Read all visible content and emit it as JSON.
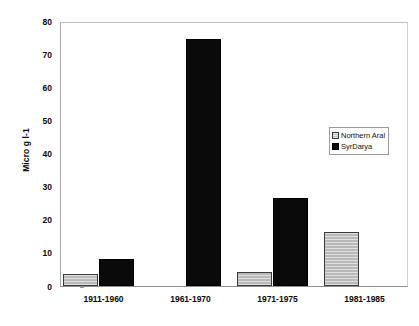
{
  "chart_data": {
    "type": "bar",
    "title": "",
    "xlabel": "",
    "ylabel": "Micro g l-1",
    "categories": [
      "1911-1960",
      "1961-1970",
      "1971-1975",
      "1981-1985"
    ],
    "series": [
      {
        "name": "Northern Aral",
        "values": [
          3.5,
          0,
          4.2,
          16.3
        ],
        "color": "#b9b9b9"
      },
      {
        "name": "SyrDarya",
        "values": [
          8.2,
          74.5,
          26.6,
          0
        ],
        "color": "#0a0a0a"
      }
    ],
    "ylim": [
      0,
      80
    ],
    "yticks": [
      0,
      10,
      20,
      30,
      40,
      50,
      60,
      70,
      80
    ],
    "grid": false,
    "legend_position": "upper-right-inside"
  },
  "legend": {
    "entries": [
      {
        "label": "Northern Aral",
        "swatch": "hatched-gray-swatch"
      },
      {
        "label": "SyrDarya",
        "swatch": "solid-black-swatch"
      }
    ]
  }
}
